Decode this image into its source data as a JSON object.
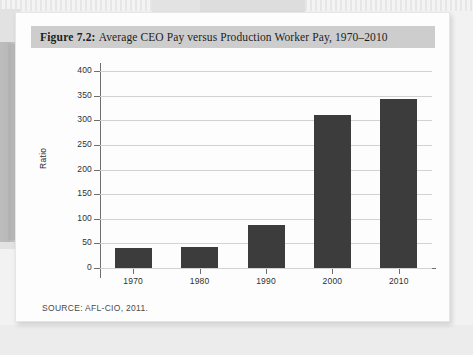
{
  "figure": {
    "number_label": "Figure 7.2:",
    "title": "Average CEO Pay versus Production Worker Pay, 1970–2010",
    "source": "SOURCE: AFL-CIO, 2011."
  },
  "colors": {
    "bar": "#3c3c3c",
    "banner": "#cdcdcd",
    "grid": "#d2d2d2",
    "axis": "#6e6e6e",
    "page": "#fdfdfd"
  },
  "chart_data": {
    "type": "bar",
    "title": "Average CEO Pay versus Production Worker Pay, 1970–2010",
    "xlabel": "",
    "ylabel": "Ratio",
    "categories": [
      "1970",
      "1980",
      "1990",
      "2000",
      "2010"
    ],
    "values": [
      40,
      42,
      88,
      310,
      343
    ],
    "ylim": [
      0,
      400
    ],
    "yticks": [
      0,
      50,
      100,
      150,
      200,
      250,
      300,
      350,
      400
    ],
    "ytick_labels": [
      "0",
      "50",
      "100",
      "150",
      "200",
      "250",
      "300",
      "350",
      "400"
    ],
    "grid": true,
    "legend": null,
    "series": [
      {
        "name": "Ratio of CEO pay to production worker pay",
        "values": [
          40,
          42,
          88,
          310,
          343
        ]
      }
    ]
  }
}
